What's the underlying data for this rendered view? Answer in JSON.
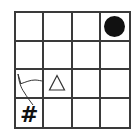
{
  "board": {
    "rows": 4,
    "cols": 4,
    "line_color": "#3a3a3a",
    "cells": [
      [
        "",
        "",
        "",
        "circle"
      ],
      [
        "",
        "",
        "",
        ""
      ],
      [
        "scribble",
        "triangle",
        "",
        ""
      ],
      [
        "hash",
        "",
        "",
        ""
      ]
    ],
    "pieces": {
      "circle": {
        "row": 0,
        "col": 3,
        "shape": "filled-circle",
        "color": "#111111"
      },
      "triangle": {
        "row": 2,
        "col": 1,
        "shape": "outline-triangle",
        "color": "#333333"
      },
      "hash": {
        "row": 3,
        "col": 0,
        "glyph": "#",
        "color": "#111111"
      },
      "scribble": {
        "row": 2,
        "col": 0,
        "shape": "hand-drawn-lines",
        "color": "#333333"
      }
    }
  }
}
